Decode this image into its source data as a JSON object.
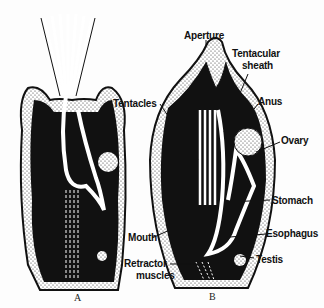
{
  "figure": {
    "panels": [
      {
        "id": "A",
        "caption": "A",
        "state": "tentacles extended"
      },
      {
        "id": "B",
        "caption": "B",
        "state": "tentacles retracted"
      }
    ],
    "labels": {
      "aperture": "Aperture",
      "tentacular_sheath_1": "Tentacular",
      "tentacular_sheath_2": "sheath",
      "anus": "Anus",
      "tentacles": "Tentacles",
      "ovary": "Ovary",
      "stomach": "Stomach",
      "mouth": "Mouth",
      "esophagus": "Esophagus",
      "testis": "Testis",
      "retractor_1": "Retractor",
      "retractor_2": "muscles"
    },
    "colors": {
      "ink": "#111111",
      "paper": "#fdfdfd"
    }
  }
}
